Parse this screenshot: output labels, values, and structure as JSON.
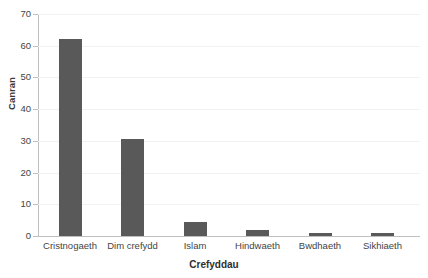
{
  "chart_data": {
    "type": "bar",
    "title": "",
    "xlabel": "Crefyddau",
    "ylabel": "Canran",
    "categories": [
      "Cristnogaeth",
      "Dim crefydd",
      "Islam",
      "Hindwaeth",
      "Bwdhaeth",
      "Sikhiaeth"
    ],
    "values": [
      62,
      30.5,
      4.3,
      2,
      1,
      1
    ],
    "ylim": [
      0,
      70
    ],
    "ytick_values": [
      0,
      10,
      20,
      30,
      40,
      50,
      60,
      70
    ],
    "ytick_labels": [
      "0",
      "10",
      "20",
      "30",
      "40",
      "50",
      "60",
      "70"
    ],
    "grid": true,
    "legend": "none",
    "bar_color": "#595959",
    "gridline_color": "#f2f2f2",
    "axis_color": "#bfbfbf"
  },
  "clipped_title": "Crefyddau yng Nghymru"
}
